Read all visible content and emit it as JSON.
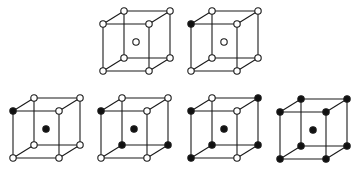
{
  "diagram": {
    "type": "cube-lattice-series",
    "colors": {
      "line": "#1a1a1a",
      "filled": "#111111",
      "open": "#ffffff"
    },
    "geometry": {
      "front_width": 46,
      "front_height": 47,
      "depth_dx": 21,
      "depth_dy": -13,
      "center_dx": 33,
      "center_dy": 18,
      "node_radius": 3.2
    },
    "vertex_order": [
      "ftl",
      "ftr",
      "fbl",
      "fbr",
      "btl",
      "btr",
      "bbl",
      "bbr",
      "center"
    ],
    "cubes": [
      {
        "id": "A",
        "row": "top",
        "anchor": [
          103,
          24
        ],
        "filled": {
          "ftl": false,
          "ftr": false,
          "fbl": false,
          "fbr": false,
          "btl": false,
          "btr": false,
          "bbl": false,
          "bbr": false,
          "center": false
        }
      },
      {
        "id": "B",
        "row": "top",
        "anchor": [
          191,
          24
        ],
        "filled": {
          "ftl": true,
          "ftr": false,
          "fbl": false,
          "fbr": false,
          "btl": false,
          "btr": false,
          "bbl": false,
          "bbr": false,
          "center": false
        }
      },
      {
        "id": "C",
        "row": "bottom",
        "anchor": [
          13,
          111
        ],
        "filled": {
          "ftl": true,
          "ftr": false,
          "fbl": false,
          "fbr": false,
          "btl": false,
          "btr": false,
          "bbl": false,
          "bbr": false,
          "center": true
        }
      },
      {
        "id": "D",
        "row": "bottom",
        "anchor": [
          101,
          111
        ],
        "filled": {
          "ftl": true,
          "ftr": false,
          "fbl": false,
          "fbr": false,
          "btl": false,
          "btr": false,
          "bbl": true,
          "bbr": true,
          "center": true
        }
      },
      {
        "id": "E",
        "row": "bottom",
        "anchor": [
          191,
          111
        ],
        "filled": {
          "ftl": true,
          "ftr": false,
          "fbl": true,
          "fbr": false,
          "btl": false,
          "btr": true,
          "bbl": true,
          "bbr": true,
          "center": true
        }
      },
      {
        "id": "F",
        "row": "bottom",
        "anchor": [
          280,
          112
        ],
        "filled": {
          "ftl": true,
          "ftr": true,
          "fbl": true,
          "fbr": true,
          "btl": true,
          "btr": true,
          "bbl": true,
          "bbr": true,
          "center": true
        }
      }
    ]
  }
}
